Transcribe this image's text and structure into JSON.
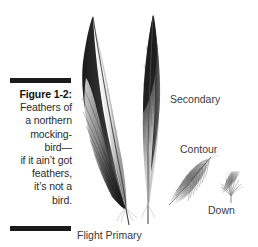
{
  "figure": {
    "number": "Figure 1-2:",
    "caption_lines": [
      "Figure 1-2:",
      "Feathers of",
      "a northern",
      "mocking-",
      "bird—",
      "if it ain’t got",
      "feathers,",
      "it’s not a",
      "bird."
    ],
    "caption_full": "Figure 1-2: Feathers of a northern mockingbird—if it ain’t got feathers, it’s not a bird."
  },
  "labels": {
    "secondary": "Secondary",
    "contour": "Contour",
    "down": "Down",
    "flight_primary": "Flight Primary"
  },
  "illustration": {
    "subjects": [
      {
        "name": "flight-primary-feather",
        "label": "Flight Primary"
      },
      {
        "name": "secondary-feather",
        "label": "Secondary"
      },
      {
        "name": "contour-feather",
        "label": "Contour"
      },
      {
        "name": "down-feather",
        "label": "Down"
      }
    ]
  },
  "colors": {
    "background": "#ffffff",
    "rule": "#1b1b1b",
    "caption_text": "#2b2b2b",
    "label_text": "#3a3a3a",
    "feather_dark": "#1f1f1f",
    "feather_mid": "#6e6e6e",
    "feather_light": "#c9c9c9"
  }
}
